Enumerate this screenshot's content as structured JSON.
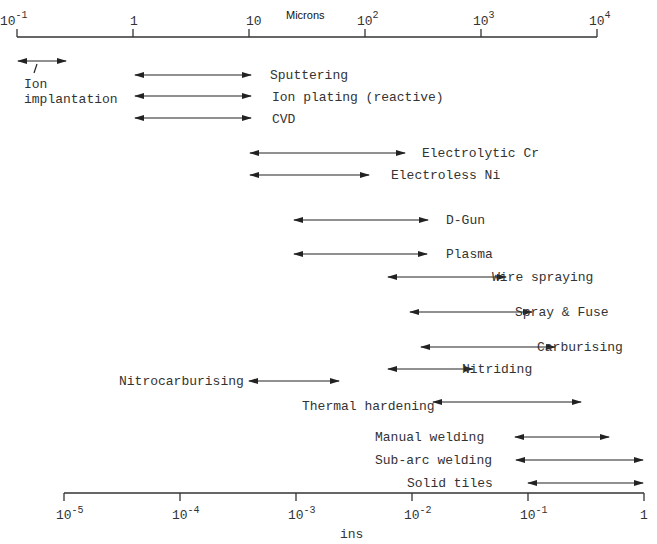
{
  "chart_data": {
    "type": "range-diagram",
    "top_axis": {
      "label": "Microns",
      "ticks": [
        {
          "base": "10",
          "exp": "-1",
          "x": 17
        },
        {
          "base": "1",
          "exp": "",
          "x": 133
        },
        {
          "base": "10",
          "exp": "",
          "x": 249
        },
        {
          "base": "10",
          "exp": "2",
          "x": 365
        },
        {
          "base": "10",
          "exp": "3",
          "x": 481
        },
        {
          "base": "10",
          "exp": "4",
          "x": 597
        }
      ]
    },
    "bottom_axis": {
      "label": "ins",
      "ticks": [
        {
          "base": "10",
          "exp": "-5",
          "x": 64
        },
        {
          "base": "10",
          "exp": "-4",
          "x": 180
        },
        {
          "base": "10",
          "exp": "-3",
          "x": 296
        },
        {
          "base": "10",
          "exp": "-2",
          "x": 412
        },
        {
          "base": "10",
          "exp": "-1",
          "x": 528
        },
        {
          "base": "1",
          "exp": "",
          "x": 644
        }
      ]
    },
    "processes": [
      {
        "name": "Ion implantation",
        "min_microns": 0.1,
        "max_microns": 0.3,
        "x1": 18,
        "x2": 66,
        "y": 61
      },
      {
        "name": "Sputtering",
        "min_microns": 1,
        "max_microns": 10,
        "x1": 135,
        "x2": 251,
        "y": 75
      },
      {
        "name": "Ion plating (reactive)",
        "min_microns": 1,
        "max_microns": 10,
        "x1": 135,
        "x2": 251,
        "y": 96
      },
      {
        "name": "CVD",
        "min_microns": 1,
        "max_microns": 10,
        "x1": 135,
        "x2": 251,
        "y": 118
      },
      {
        "name": "Electrolytic Cr",
        "min_microns": 10,
        "max_microns": 200,
        "x1": 250,
        "x2": 405,
        "y": 153
      },
      {
        "name": "Electroless Ni",
        "min_microns": 10,
        "max_microns": 130,
        "x1": 250,
        "x2": 369,
        "y": 175
      },
      {
        "name": "D-Gun",
        "min_microns": 25,
        "max_microns": 250,
        "x1": 294,
        "x2": 428,
        "y": 220
      },
      {
        "name": "Plasma",
        "min_microns": 25,
        "max_microns": 250,
        "x1": 294,
        "x2": 427,
        "y": 254
      },
      {
        "name": "Wire spraying",
        "min_microns": 150,
        "max_microns": 1500,
        "x1": 388,
        "x2": 506,
        "y": 277
      },
      {
        "name": "Spray & Fuse",
        "min_microns": 300,
        "max_microns": 2500,
        "x1": 410,
        "x2": 532,
        "y": 312
      },
      {
        "name": "Carburising",
        "min_microns": 400,
        "max_microns": 3500,
        "x1": 421,
        "x2": 555,
        "y": 347
      },
      {
        "name": "Nitriding",
        "min_microns": 150,
        "max_microns": 700,
        "x1": 388,
        "x2": 473,
        "y": 369
      },
      {
        "name": "Nitrocarburising",
        "min_microns": 10,
        "max_microns": 80,
        "x1": 249,
        "x2": 339,
        "y": 381
      },
      {
        "name": "Thermal hardening",
        "min_microns": 250,
        "max_microns": 6000,
        "x1": 433,
        "x2": 581,
        "y": 402
      },
      {
        "name": "Manual welding",
        "min_microns": 2000,
        "max_microns": 12500,
        "x1": 515,
        "x2": 609,
        "y": 437
      },
      {
        "name": "Sub-arc welding",
        "min_microns": 2000,
        "max_microns": 25000,
        "x1": 516,
        "x2": 643,
        "y": 460
      },
      {
        "name": "Solid tiles",
        "min_microns": 2500,
        "max_microns": 25000,
        "x1": 528,
        "x2": 643,
        "y": 483
      }
    ]
  }
}
